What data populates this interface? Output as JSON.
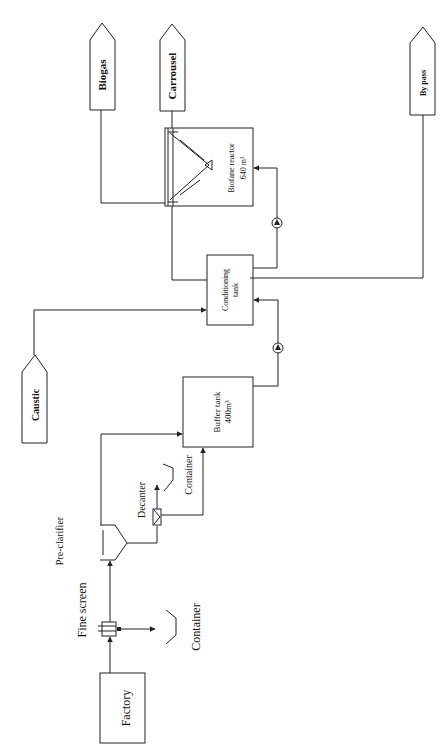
{
  "diagram": {
    "title": "",
    "nodes": {
      "factory": {
        "label": "Factory"
      },
      "fine_screen": {
        "label": "Fine screen"
      },
      "container_1": {
        "label": "Container"
      },
      "pre_clarifier": {
        "label": "Pre-clarifier"
      },
      "decanter": {
        "label": "Decanter"
      },
      "container_2": {
        "label": "Container"
      },
      "buffer_tank": {
        "label": "Buffer tank",
        "volume": "400m³"
      },
      "caustic": {
        "label": "Caustic"
      },
      "conditioning_tank": {
        "label": "Conditioning",
        "label2": "tank"
      },
      "biofane_reactor": {
        "label": "Biofane reactor",
        "volume": "640 m³"
      },
      "biogas": {
        "label": "Biogas"
      },
      "carrousel": {
        "label": "Carrousel"
      },
      "by_pass": {
        "label": "By pass"
      }
    },
    "edges": [
      {
        "from": "factory",
        "to": "fine_screen"
      },
      {
        "from": "fine_screen",
        "to": "container_1"
      },
      {
        "from": "fine_screen",
        "to": "pre_clarifier"
      },
      {
        "from": "pre_clarifier",
        "to": "decanter"
      },
      {
        "from": "decanter",
        "to": "container_2"
      },
      {
        "from": "decanter",
        "to": "buffer_tank"
      },
      {
        "from": "pre_clarifier",
        "to": "buffer_tank"
      },
      {
        "from": "buffer_tank",
        "to": "conditioning_tank",
        "via": "pump"
      },
      {
        "from": "caustic",
        "to": "conditioning_tank"
      },
      {
        "from": "conditioning_tank",
        "to": "biofane_reactor",
        "via": "pump"
      },
      {
        "from": "biofane_reactor",
        "to": "biogas"
      },
      {
        "from": "biofane_reactor",
        "to": "carrousel"
      },
      {
        "from": "conditioning_tank",
        "to": "by_pass"
      },
      {
        "from": "biofane_reactor",
        "to": "conditioning_tank"
      }
    ]
  }
}
